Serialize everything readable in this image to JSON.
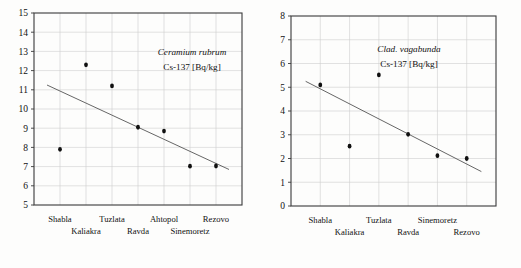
{
  "figure": {
    "background_color": "#fdfdfc",
    "axis_color": "#3a3a3a",
    "grid_color": "#cfcfcf",
    "point_color": "#101010",
    "trend_color": "#555555"
  },
  "chart_data": [
    {
      "id": "left",
      "type": "scatter",
      "title": "",
      "annotation_species": "Ceramium rubrum",
      "annotation_unit": "Cs-137 [Bq/kg]",
      "xlabel": "",
      "ylabel": "",
      "ylim": [
        5,
        15
      ],
      "yticks": [
        5,
        6,
        7,
        8,
        9,
        10,
        11,
        12,
        13,
        14,
        15
      ],
      "grid": true,
      "legend": "none",
      "categories": [
        "Shabla",
        "Kaliakra",
        "Tuzlata",
        "Ravda",
        "Ahtopol",
        "Sinemoretz",
        "Rezovo"
      ],
      "x": [
        1,
        2,
        3,
        4,
        5,
        6,
        7
      ],
      "values": [
        7.9,
        12.3,
        11.2,
        9.05,
        8.85,
        7.02,
        7.03
      ],
      "trendline": {
        "x_start": 0.5,
        "y_start": 11.25,
        "x_end": 7.5,
        "y_end": 6.85
      }
    },
    {
      "id": "right",
      "type": "scatter",
      "title": "",
      "annotation_species": "Clad. vagabunda",
      "annotation_unit": "Cs-137 [Bq/kg]",
      "xlabel": "",
      "ylabel": "",
      "ylim": [
        0,
        8
      ],
      "yticks": [
        0,
        1,
        2,
        3,
        4,
        5,
        6,
        7,
        8
      ],
      "grid": true,
      "legend": "none",
      "categories": [
        "Shabla",
        "Kaliakra",
        "Tuzlata",
        "Ravda",
        "Sinemoretz",
        "Rezovo"
      ],
      "x": [
        1,
        2,
        3,
        4,
        5,
        6
      ],
      "values": [
        5.1,
        2.52,
        5.52,
        3.02,
        2.12,
        2.0
      ],
      "trendline": {
        "x_start": 0.5,
        "y_start": 5.25,
        "x_end": 6.5,
        "y_end": 1.45
      }
    }
  ],
  "left_chart": {
    "yticks": [
      "15",
      "14",
      "13",
      "12",
      "11",
      "10",
      "9",
      "8",
      "7",
      "6",
      "5"
    ],
    "annotation_species": "Ceramium rubrum",
    "annotation_unit": "Cs-137 [Bq/kg]",
    "xlabels_row1": [
      "Shabla",
      "Tuzlata",
      "Ahtopol",
      "Rezovo"
    ],
    "xlabels_row2": [
      "Kaliakra",
      "Ravda",
      "Sinemoretz"
    ]
  },
  "right_chart": {
    "yticks": [
      "8",
      "7",
      "6",
      "5",
      "4",
      "3",
      "2",
      "1",
      "0"
    ],
    "annotation_species": "Clad. vagabunda",
    "annotation_unit": "Cs-137 [Bq/kg]",
    "xlabels_row1": [
      "Shabla",
      "Tuzlata",
      "Sinemoretz"
    ],
    "xlabels_row2": [
      "Kaliakra",
      "Ravda",
      "Rezovo"
    ]
  }
}
